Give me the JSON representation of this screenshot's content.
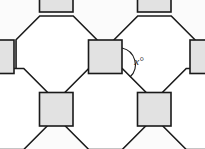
{
  "figure": {
    "name": "semi-regular-tessellation-octagons-squares",
    "background_color": "#fbfbfb",
    "octagon_fill": "#ffffff",
    "square_fill": "#e2e2e2",
    "stroke_color": "#1a1a1a",
    "stroke_width": 1.6,
    "width": 205,
    "height": 149
  },
  "annotation": {
    "angle_label": "x°",
    "angle_label_x": 139,
    "angle_label_y": 62,
    "arc_path": "M 122 48 A 17 17 0 0 1 130 77",
    "arc_color": "#1a1a1a"
  },
  "geometry": {
    "unit": 74.5,
    "square_side": 33.5,
    "squares": [
      {
        "name": "square-top-left",
        "x": 39.5,
        "y": -21.5,
        "w": 33.5,
        "h": 33.5
      },
      {
        "name": "square-top-right",
        "x": 137.5,
        "y": -21.5,
        "w": 33.5,
        "h": 33.5
      },
      {
        "name": "square-left-middle",
        "x": -19.5,
        "y": 40.0,
        "w": 33.5,
        "h": 33.5
      },
      {
        "name": "square-center",
        "x": 88.5,
        "y": 40.0,
        "w": 33.5,
        "h": 33.5
      },
      {
        "name": "square-right-middle",
        "x": 190.0,
        "y": 40.0,
        "w": 33.5,
        "h": 33.5
      },
      {
        "name": "square-bottom-left",
        "x": 39.5,
        "y": 92.5,
        "w": 33.5,
        "h": 33.5
      },
      {
        "name": "square-bottom-right",
        "x": 137.5,
        "y": 92.5,
        "w": 33.5,
        "h": 33.5
      }
    ],
    "octagons": [
      {
        "name": "octagon-upper-left",
        "cx": 56.5,
        "cy": 56.5
      },
      {
        "name": "octagon-upper-right",
        "cx": 154.5,
        "cy": 56.5
      },
      {
        "name": "octagon-lower-left",
        "cx": 7.0,
        "cy": 109.0
      },
      {
        "name": "octagon-lower-middle",
        "cx": 105.5,
        "cy": 109.0
      },
      {
        "name": "octagon-lower-right",
        "cx": 203.0,
        "cy": 109.0
      }
    ],
    "octagon_points": "-16.75,-40.45 16.75,-40.45 40.45,-16.75 40.45,16.75 16.75,40.45 -16.75,40.45 -40.45,16.75 -40.45,-16.75"
  }
}
